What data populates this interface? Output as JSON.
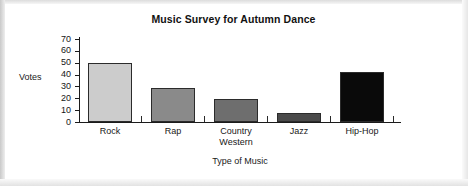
{
  "chart_data": {
    "type": "bar",
    "title": "Music Survey for Autumn Dance",
    "xlabel": "Type of Music",
    "ylabel": "Votes",
    "categories": [
      "Rock",
      "Rap",
      "Country Western",
      "Jazz",
      "Hip-Hop"
    ],
    "category_lines": [
      [
        "Rock"
      ],
      [
        "Rap"
      ],
      [
        "Country",
        "Western"
      ],
      [
        "Jazz"
      ],
      [
        "Hip-Hop"
      ]
    ],
    "values": [
      50,
      29,
      19,
      8,
      42
    ],
    "ylim": [
      0,
      70
    ],
    "yticks": [
      70,
      60,
      50,
      40,
      30,
      20,
      10,
      0
    ],
    "grid": false,
    "legend": "none",
    "bar_colors": [
      "#cccccc",
      "#8a8a8a",
      "#6e6e6e",
      "#4a4a4a",
      "#0a0a0a"
    ],
    "bar_outline": "#2b2b2b"
  }
}
